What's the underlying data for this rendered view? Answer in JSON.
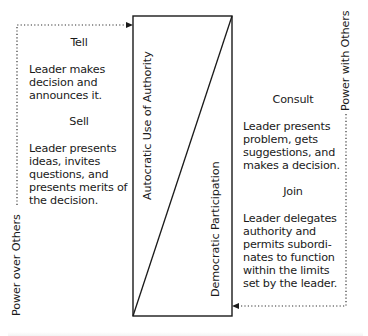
{
  "diagram": {
    "type": "leadership-continuum",
    "colors": {
      "line": "#1a1a1a",
      "dotted": "#333333",
      "background": "#ffffff"
    },
    "box_labels": {
      "autocratic": "Autocratic Use of Authority",
      "democratic": "Democratic Participation"
    },
    "side_labels": {
      "left": "Power over Others",
      "right": "Power with Others"
    },
    "left_column": [
      {
        "heading": "Tell",
        "text": "Leader makes\ndecision and\nannounces it."
      },
      {
        "heading": "Sell",
        "text": "Leader presents\nideas, invites\nquestions, and\npresents merits of\nthe decision."
      }
    ],
    "right_column": [
      {
        "heading": "Consult",
        "text": "Leader presents\nproblem, gets\nsuggestions, and\nmakes a decision."
      },
      {
        "heading": "Join",
        "text": "Leader delegates\nauthority and\npermits subordi-\nnates to function\nwithin the limits\nset by the leader."
      }
    ]
  }
}
